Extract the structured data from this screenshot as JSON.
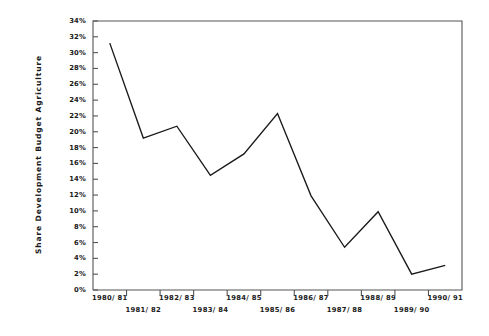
{
  "chart_data": {
    "type": "line",
    "title": "",
    "xlabel": "",
    "ylabel": "Share Development Budget Agriculture",
    "categories": [
      "1980/ 81",
      "1981/ 82",
      "1982/ 83",
      "1983/ 84",
      "1984/ 85",
      "1985/ 86",
      "1986/ 87",
      "1987/ 88",
      "1988/ 89",
      "1989/ 90",
      "1990/ 91"
    ],
    "values": [
      31.2,
      19.2,
      20.7,
      14.5,
      17.2,
      22.3,
      11.9,
      5.4,
      9.9,
      2.0,
      3.1
    ],
    "ylim": [
      0,
      34
    ],
    "ytick_labels": [
      "34%",
      "32%",
      "30%",
      "28%",
      "26%",
      "24%",
      "22%",
      "20%",
      "18%",
      "16%",
      "14%",
      "12%",
      "10%",
      "8%",
      "6%",
      "4%",
      "2%",
      "0%"
    ],
    "ytick_values": [
      34,
      32,
      30,
      28,
      26,
      24,
      22,
      20,
      18,
      16,
      14,
      12,
      10,
      8,
      6,
      4,
      2,
      0
    ],
    "grid": false,
    "legend": "none",
    "line_color": "#1a1a1a",
    "axis_color": "#555555",
    "background_color": "#ffffff"
  }
}
